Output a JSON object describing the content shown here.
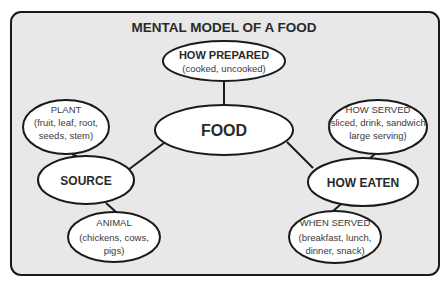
{
  "diagram": {
    "title": "MENTAL MODEL OF A FOOD",
    "colors": {
      "panel": "#e8e8e8",
      "stroke": "#1a1a1a",
      "node_fill": "#ffffff",
      "text": "#2a2a2a"
    },
    "nodes": {
      "food": {
        "label": "FOOD"
      },
      "how_prepared": {
        "label": "HOW PREPARED",
        "detail": [
          "(cooked, uncooked)"
        ]
      },
      "source": {
        "label": "SOURCE"
      },
      "plant": {
        "label": "PLANT",
        "detail": [
          "(fruit, leaf, root,",
          "seeds, stem)"
        ]
      },
      "animal": {
        "label": "ANIMAL",
        "detail": [
          "(chickens, cows,",
          "pigs)"
        ]
      },
      "how_eaten": {
        "label": "HOW EATEN"
      },
      "how_served": {
        "label": "HOW SERVED",
        "detail": [
          "(sliced, drink, sandwich,",
          "large serving)"
        ]
      },
      "when_served": {
        "label": "WHEN SERVED",
        "detail": [
          "(breakfast, lunch,",
          "dinner, snack)"
        ]
      }
    },
    "edges": [
      [
        "food",
        "how_prepared"
      ],
      [
        "food",
        "source"
      ],
      [
        "food",
        "how_eaten"
      ],
      [
        "source",
        "plant"
      ],
      [
        "source",
        "animal"
      ],
      [
        "how_eaten",
        "how_served"
      ],
      [
        "how_eaten",
        "when_served"
      ]
    ]
  }
}
